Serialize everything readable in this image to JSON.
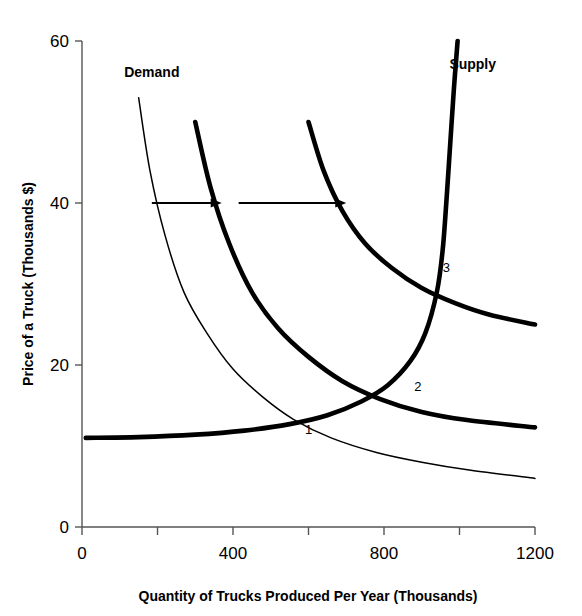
{
  "chart_data": {
    "type": "line",
    "title": "",
    "xlabel": "Quantity of Trucks Produced Per Year (Thousands)",
    "ylabel": "Price of a Truck (Thousands $)",
    "xlim": [
      0,
      1200
    ],
    "ylim": [
      0,
      60
    ],
    "grid": false,
    "legend_position": "inline-curve-labels",
    "x_ticks": [
      0,
      200,
      400,
      600,
      800,
      1000,
      1200
    ],
    "x_tick_labels": [
      "0",
      "",
      "400",
      "",
      "800",
      "",
      "1200"
    ],
    "y_ticks": [
      0,
      20,
      40,
      60
    ],
    "y_tick_labels": [
      "0",
      "20",
      "40",
      "60"
    ],
    "series": [
      {
        "name": "Demand 1",
        "style": "thin",
        "points": [
          [
            150,
            53
          ],
          [
            180,
            44
          ],
          [
            220,
            36
          ],
          [
            270,
            29
          ],
          [
            330,
            24
          ],
          [
            400,
            19.5
          ],
          [
            480,
            16
          ],
          [
            560,
            13.3
          ],
          [
            660,
            11
          ],
          [
            780,
            9.2
          ],
          [
            900,
            8
          ],
          [
            1030,
            7
          ],
          [
            1200,
            6
          ]
        ]
      },
      {
        "name": "Demand 2",
        "style": "thick",
        "points": [
          [
            300,
            50
          ],
          [
            340,
            42
          ],
          [
            390,
            35
          ],
          [
            450,
            29
          ],
          [
            520,
            24.5
          ],
          [
            600,
            21
          ],
          [
            690,
            18
          ],
          [
            790,
            15.8
          ],
          [
            900,
            14.2
          ],
          [
            1020,
            13.2
          ],
          [
            1200,
            12.3
          ]
        ]
      },
      {
        "name": "Demand 3",
        "style": "thick",
        "points": [
          [
            600,
            50
          ],
          [
            640,
            44
          ],
          [
            690,
            39
          ],
          [
            750,
            35
          ],
          [
            820,
            32
          ],
          [
            900,
            29.5
          ],
          [
            990,
            27.6
          ],
          [
            1080,
            26.2
          ],
          [
            1200,
            25
          ]
        ]
      },
      {
        "name": "Supply",
        "style": "thick",
        "points": [
          [
            10,
            11
          ],
          [
            150,
            11.1
          ],
          [
            300,
            11.4
          ],
          [
            430,
            11.9
          ],
          [
            550,
            12.7
          ],
          [
            650,
            13.8
          ],
          [
            740,
            15.5
          ],
          [
            810,
            17.5
          ],
          [
            870,
            20.5
          ],
          [
            910,
            24
          ],
          [
            940,
            29
          ],
          [
            955,
            34
          ],
          [
            965,
            40
          ],
          [
            975,
            47
          ],
          [
            985,
            54
          ],
          [
            995,
            60
          ]
        ]
      }
    ],
    "curve_labels": [
      {
        "text": "Demand",
        "x": 185,
        "y": 55.5
      },
      {
        "text": "Supply",
        "x": 1035,
        "y": 56.5
      }
    ],
    "equilibrium_points": [
      {
        "label": "1",
        "x": 600,
        "y": 11.5
      },
      {
        "label": "2",
        "x": 890,
        "y": 16.8
      },
      {
        "label": "3",
        "x": 965,
        "y": 31.5
      }
    ],
    "annotations": [
      {
        "kind": "shift-arrow",
        "name": "demand-shift-arrow-1",
        "x_start": 185,
        "x_end": 370,
        "y": 40
      },
      {
        "kind": "shift-arrow",
        "name": "demand-shift-arrow-2",
        "x_start": 415,
        "x_end": 700,
        "y": 40
      }
    ]
  },
  "colors": {
    "ink": "#000000",
    "axis": "#555555",
    "background": "#ffffff"
  }
}
